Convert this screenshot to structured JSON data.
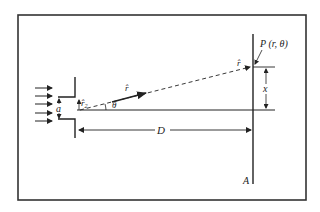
{
  "diagram": {
    "type": "single-slit diffraction geometry",
    "labels": {
      "slit_width": "a",
      "r_small": "r̂",
      "r_small_sub": "2",
      "r_hat_mid": "r̂",
      "r_hat_screen": "r̂",
      "theta": "θ",
      "distance": "D",
      "point": "P (r, θ)",
      "displacement": "x",
      "screen": "A"
    },
    "incoming_arrows": 5,
    "colors": {
      "line": "#222222",
      "border": "#333333",
      "background": "#ffffff"
    }
  }
}
